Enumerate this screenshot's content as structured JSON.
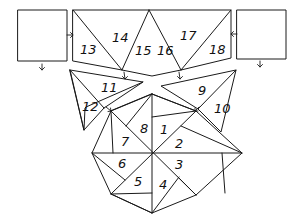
{
  "diagram": {
    "type": "folding-net",
    "colors": {
      "line": "#1a1a1a",
      "background": "#ffffff"
    },
    "squares": [
      {
        "id": "left-square",
        "label": ""
      },
      {
        "id": "right-square",
        "label": ""
      }
    ],
    "faces": [
      {
        "n": "1"
      },
      {
        "n": "2"
      },
      {
        "n": "3"
      },
      {
        "n": "4"
      },
      {
        "n": "5"
      },
      {
        "n": "6"
      },
      {
        "n": "7"
      },
      {
        "n": "8"
      },
      {
        "n": "9"
      },
      {
        "n": "10"
      },
      {
        "n": "11"
      },
      {
        "n": "12"
      },
      {
        "n": "13"
      },
      {
        "n": "14"
      },
      {
        "n": "15"
      },
      {
        "n": "16"
      },
      {
        "n": "17"
      },
      {
        "n": "18"
      }
    ]
  }
}
